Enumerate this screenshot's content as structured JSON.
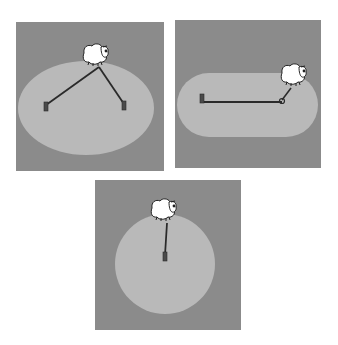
{
  "figure": {
    "colors": {
      "page": "#ffffff",
      "field": "#8b8b8b",
      "grazing_area": "#b9b9b9",
      "rope": "#2a2a2a",
      "post": "#4a4a4a",
      "sheep_wool": "#ffffff",
      "sheep_outline": "#222222"
    },
    "panels": [
      {
        "id": "two-posts-ellipse",
        "x": 16,
        "y": 22,
        "w": 148,
        "h": 149,
        "area": {
          "shape": "ellipse",
          "cx": 70,
          "cy": 86,
          "rx": 68,
          "ry": 47
        },
        "posts": [
          {
            "x": 30,
            "y": 86
          },
          {
            "x": 108,
            "y": 85
          }
        ],
        "rope_junction": {
          "x": 83,
          "y": 45
        },
        "sheep": {
          "x": 79,
          "y": 33
        }
      },
      {
        "id": "rail-stadium",
        "x": 175,
        "y": 20,
        "w": 146,
        "h": 148,
        "area": {
          "shape": "stadium",
          "x": 2,
          "y": 53,
          "w": 141,
          "h": 64,
          "r": 32
        },
        "posts": [
          {
            "x": 27,
            "y": 80
          }
        ],
        "rail": {
          "x1": 27,
          "y1": 82,
          "x2": 107,
          "y2": 82
        },
        "rope_junction": {
          "x": 107,
          "y": 82
        },
        "sheep_rope_end": {
          "x": 116,
          "y": 68
        },
        "sheep": {
          "x": 118,
          "y": 55
        }
      },
      {
        "id": "single-post-circle",
        "x": 95,
        "y": 180,
        "w": 146,
        "h": 150,
        "area": {
          "shape": "circle",
          "cx": 70,
          "cy": 84,
          "r": 50
        },
        "posts": [
          {
            "x": 70,
            "y": 78
          }
        ],
        "rope_junction": {
          "x": 72,
          "y": 43
        },
        "sheep": {
          "x": 68,
          "y": 30
        }
      }
    ]
  }
}
